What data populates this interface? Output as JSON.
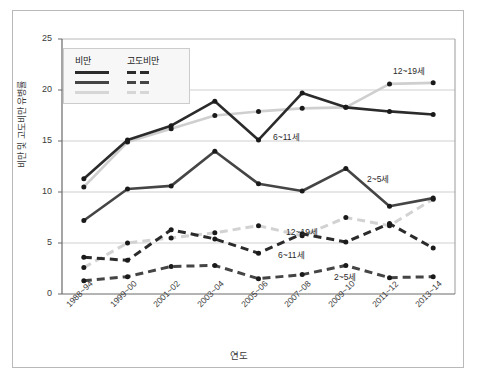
{
  "chart_data": {
    "type": "line",
    "title": "",
    "xlabel": "연도",
    "ylabel": "비만 및 고도비만 유병률",
    "categories": [
      "1988~94",
      "1999~00",
      "2001~02",
      "2003~04",
      "2005~06",
      "2007~08",
      "2009~10",
      "2011~12",
      "2013~14"
    ],
    "ylim": [
      0,
      25
    ],
    "yticks": [
      0,
      5,
      10,
      15,
      20,
      25
    ],
    "grid": true,
    "legend_position": "upper-left",
    "legend_groups": [
      "비만",
      "고도비만"
    ],
    "series": [
      {
        "name": "비만 6~11세",
        "group": "비만",
        "style": "solid",
        "color": "#2b2b2b",
        "values": [
          11.3,
          15.1,
          16.5,
          18.9,
          15.1,
          19.7,
          18.3,
          17.9,
          17.6
        ]
      },
      {
        "name": "비만 12~19세",
        "group": "비만",
        "style": "solid",
        "color": "#cfcfcf",
        "values": [
          10.5,
          14.9,
          16.2,
          17.5,
          17.9,
          18.2,
          18.3,
          20.6,
          20.7
        ]
      },
      {
        "name": "비만 2~5세",
        "group": "비만",
        "style": "solid",
        "color": "#454545",
        "values": [
          7.2,
          10.3,
          10.6,
          14.0,
          10.8,
          10.1,
          12.3,
          8.6,
          9.4
        ]
      },
      {
        "name": "고도비만 6~11세",
        "group": "고도비만",
        "style": "dashed",
        "color": "#2b2b2b",
        "values": [
          3.6,
          3.3,
          6.3,
          5.4,
          4.0,
          5.9,
          5.1,
          6.9,
          4.5
        ]
      },
      {
        "name": "고도비만 12~19세",
        "group": "고도비만",
        "style": "dashed",
        "color": "#d2d2d2",
        "values": [
          2.6,
          5.0,
          5.5,
          6.0,
          6.7,
          5.7,
          7.5,
          6.7,
          9.3
        ]
      },
      {
        "name": "고도비만 2~5세",
        "group": "고도비만",
        "style": "dashed",
        "color": "#454545",
        "values": [
          1.3,
          1.7,
          2.7,
          2.8,
          1.5,
          1.9,
          2.8,
          1.6,
          1.7
        ]
      }
    ],
    "annotations": [
      {
        "id": "ann-obesity-12-19",
        "text": "12~19세",
        "x": 393,
        "y": 64
      },
      {
        "id": "ann-obesity-6-11",
        "text": "6~11세",
        "x": 273,
        "y": 130
      },
      {
        "id": "ann-obesity-2-5",
        "text": "2~5세",
        "x": 367,
        "y": 172
      },
      {
        "id": "ann-severe-12-19",
        "text": "12~19세",
        "x": 286,
        "y": 225
      },
      {
        "id": "ann-severe-6-11",
        "text": "6~11세",
        "x": 278,
        "y": 248
      },
      {
        "id": "ann-severe-2-5",
        "text": "2~5세",
        "x": 334,
        "y": 270
      }
    ]
  },
  "legend": {
    "col1_title": "비만",
    "col2_title": "고도비만"
  },
  "colors": {
    "axis": "#5a5a5a",
    "grid": "#cfcfcf",
    "frame": "#b9b9b9",
    "text": "#3a3a3a",
    "dark_line": "#2b2b2b",
    "mid_line": "#454545",
    "light_line": "#cfcfcf"
  }
}
